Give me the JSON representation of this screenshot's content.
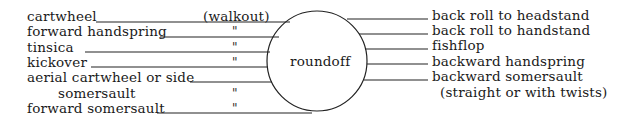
{
  "diagram": {
    "center": {
      "label": "roundoff"
    },
    "left_items": [
      {
        "label": "cartwheel",
        "note": "(walkout)"
      },
      {
        "label": "forward handspring",
        "note": "\""
      },
      {
        "label": "tinsica",
        "note": "\""
      },
      {
        "label": "kickover",
        "note": "\""
      },
      {
        "label": "aerial cartwheel or side",
        "label_cont": "somersault",
        "note": "\""
      },
      {
        "label": "forward somersault",
        "note": "\""
      }
    ],
    "right_items": [
      {
        "label": "back roll to headstand"
      },
      {
        "label": "back roll to handstand"
      },
      {
        "label": "fishflop"
      },
      {
        "label": "backward handspring"
      },
      {
        "label": "backward somersault",
        "label_cont": "(straight or with twists)"
      }
    ]
  }
}
